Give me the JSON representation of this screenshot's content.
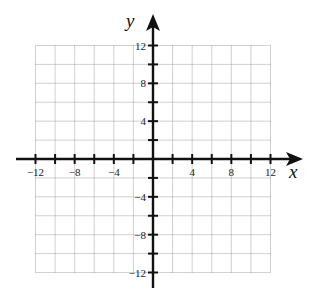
{
  "chart_data": {
    "type": "scatter",
    "title": "",
    "subtitle": "",
    "xlabel": "x",
    "ylabel": "y",
    "xlim": [
      -12,
      12
    ],
    "ylim": [
      -12,
      12
    ],
    "grid": true,
    "grid_step": 2,
    "tick_step": 2,
    "x_tick_labels": [
      "-12",
      "-8",
      "-4",
      "4",
      "8",
      "12"
    ],
    "x_tick_label_values": [
      -12,
      -8,
      -4,
      4,
      8,
      12
    ],
    "y_tick_labels": [
      "12",
      "8",
      "4",
      "-4",
      "-8",
      "-12"
    ],
    "y_tick_label_values": [
      12,
      8,
      4,
      -4,
      -8,
      -12
    ],
    "series": [],
    "legend": null,
    "annotations": []
  },
  "axes": {
    "x_label": "x",
    "y_label": "y"
  },
  "colors": {
    "axis": "#111111",
    "grid": "#8a8a8a",
    "background": "#ffffff"
  }
}
